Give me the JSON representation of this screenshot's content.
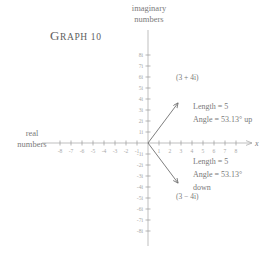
{
  "title": {
    "first_letter": "G",
    "rest": "RAPH",
    "number": "10",
    "full": "GRAPH 10"
  },
  "axes": {
    "imaginary_label": "imaginary\nnumbers",
    "imaginary_line1": "imaginary",
    "imaginary_line2": "numbers",
    "real_label": "real\nnumbers",
    "real_line1": "real",
    "real_line2": "numbers",
    "x_axis_name": "x"
  },
  "annotations": {
    "upper_point": "(3 + 4i)",
    "lower_point": "(3 − 4i)",
    "up_line1": "Length = 5",
    "up_line2": "Angle = 53.13° up",
    "down_line1": "Length = 5",
    "down_line2": "Angle = 53.13°",
    "down_line3": "down"
  },
  "colors": {
    "axis": "#9a9a9a",
    "tick_text": "#a8a8a8",
    "vector": "#6f6f6f",
    "text": "#6b6b6b",
    "background": "#ffffff"
  },
  "chart_data": {
    "type": "scatter",
    "xlabel": "real numbers",
    "ylabel": "imaginary numbers",
    "xlim": [
      -8.6,
      8.8
    ],
    "ylim": [
      -8.6,
      8.6
    ],
    "grid": false,
    "legend": "none",
    "x_ticks": [
      -8,
      -7,
      -6,
      -5,
      -4,
      -3,
      -2,
      -1,
      1,
      2,
      3,
      4,
      5,
      6,
      7,
      8
    ],
    "x_tick_labels": [
      "-8",
      "-7",
      "-6",
      "-5",
      "-4",
      "-3",
      "-2",
      "-1",
      "1",
      "2",
      "3",
      "4",
      "5",
      "6",
      "7",
      "8"
    ],
    "y_ticks": [
      8,
      7,
      6,
      5,
      4,
      3,
      2,
      1,
      -1,
      -2,
      -3,
      -4,
      -5,
      -6,
      -7,
      -8
    ],
    "y_tick_labels": [
      "8i",
      "7i",
      "6i",
      "5i",
      "4i",
      "3i",
      "2i",
      "1i",
      "-1i",
      "-2i",
      "-3i",
      "-4i",
      "-5i",
      "-6i",
      "-7i",
      "-8i"
    ],
    "vectors": [
      {
        "name": "3 + 4i",
        "from": [
          0,
          0
        ],
        "to": [
          3,
          4
        ],
        "label": "(3 + 4i)",
        "length": 5,
        "angle_deg": 53.13,
        "direction": "up"
      },
      {
        "name": "3 - 4i",
        "from": [
          0,
          0
        ],
        "to": [
          3,
          -4
        ],
        "label": "(3 − 4i)",
        "length": 5,
        "angle_deg": 53.13,
        "direction": "down"
      }
    ]
  }
}
